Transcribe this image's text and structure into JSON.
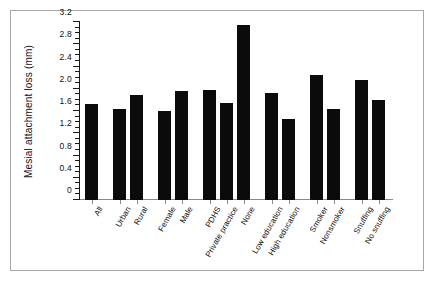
{
  "chart_data": {
    "type": "bar",
    "title": "",
    "subtitle": "",
    "xlabel": "",
    "ylabel": "Mesial attachment loss (mm)",
    "ylim": [
      0,
      3.2
    ],
    "ytick_labels": [
      "0",
      "0.4",
      "0.8",
      "1.2",
      "1.6",
      "2.0",
      "2.4",
      "2.8",
      "3.2"
    ],
    "ytick_values": [
      0,
      0.4,
      0.8,
      1.2,
      1.6,
      2.0,
      2.4,
      2.8,
      3.2
    ],
    "minor_tick_step": 0.1,
    "grid": false,
    "legend": false,
    "legend_position": "none",
    "bar_color": "#0b0b0b",
    "categories": [
      "All",
      "Urban",
      "Rural",
      "Female",
      "Male",
      "PDHS",
      "Private practice",
      "None",
      "Low education",
      "High education",
      "Smoker",
      "Nonsmoker",
      "Snuffing",
      "No snuffing"
    ],
    "values": [
      1.73,
      1.64,
      1.89,
      1.6,
      1.96,
      1.97,
      1.75,
      3.14,
      1.92,
      1.45,
      2.24,
      1.64,
      2.15,
      1.79
    ],
    "groups": [
      {
        "name": "overall",
        "categories": [
          "All"
        ]
      },
      {
        "name": "residence",
        "categories": [
          "Urban",
          "Rural"
        ]
      },
      {
        "name": "sex",
        "categories": [
          "Female",
          "Male"
        ]
      },
      {
        "name": "dental-care",
        "categories": [
          "PDHS",
          "Private practice",
          "None"
        ]
      },
      {
        "name": "education",
        "categories": [
          "Low education",
          "High education"
        ]
      },
      {
        "name": "smoking",
        "categories": [
          "Smoker",
          "Nonsmoker"
        ]
      },
      {
        "name": "snuffing",
        "categories": [
          "Snuffing",
          "No snuffing"
        ]
      }
    ]
  }
}
